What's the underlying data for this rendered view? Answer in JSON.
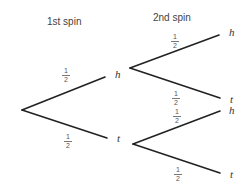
{
  "headers": {
    "first": "1st spin",
    "second": "2nd spin"
  },
  "tree": {
    "level1": [
      {
        "outcome": "h",
        "prob_num": "1",
        "prob_den": "2"
      },
      {
        "outcome": "t",
        "prob_num": "1",
        "prob_den": "2"
      }
    ],
    "level2_from_h": [
      {
        "outcome": "h",
        "prob_num": "1",
        "prob_den": "2"
      },
      {
        "outcome": "t",
        "prob_num": "1",
        "prob_den": "2"
      }
    ],
    "level2_from_t": [
      {
        "outcome": "h",
        "prob_num": "1",
        "prob_den": "2"
      },
      {
        "outcome": "t",
        "prob_num": "1",
        "prob_den": "2"
      }
    ]
  },
  "colors": {
    "line": "#222222",
    "text": "#444444"
  }
}
